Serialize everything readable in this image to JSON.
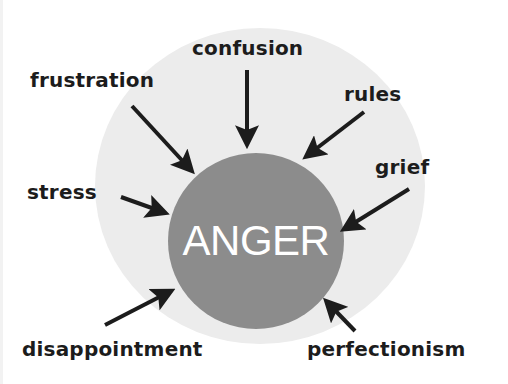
{
  "diagram": {
    "type": "cause-concept-diagram",
    "center": {
      "label": "ANGER",
      "color": "#8c8c8c",
      "text_color": "#ffffff"
    },
    "outer_ring_color": "#ececec",
    "arrow_color": "#1c1c1c",
    "causes": [
      {
        "id": "confusion",
        "label": "confusion"
      },
      {
        "id": "frustration",
        "label": "frustration"
      },
      {
        "id": "rules",
        "label": "rules"
      },
      {
        "id": "grief",
        "label": "grief"
      },
      {
        "id": "stress",
        "label": "stress"
      },
      {
        "id": "disappointment",
        "label": "disappointment"
      },
      {
        "id": "perfectionism",
        "label": "perfectionism"
      }
    ]
  }
}
